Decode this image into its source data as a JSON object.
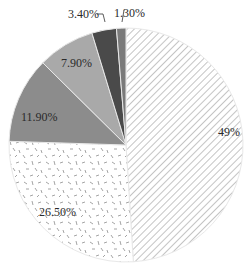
{
  "chart_data": {
    "type": "pie",
    "title": "",
    "start_angle": "12 o'clock",
    "direction": "clockwise",
    "slices": [
      {
        "label": "49%",
        "value": 49.0,
        "fill": "hatch-diagonal",
        "color": "#ffffff"
      },
      {
        "label": "26.50%",
        "value": 26.5,
        "fill": "dash-scatter",
        "color": "#ffffff"
      },
      {
        "label": "11.90%",
        "value": 11.9,
        "fill": "solid",
        "color": "#8c8c8c"
      },
      {
        "label": "7.90%",
        "value": 7.9,
        "fill": "solid",
        "color": "#a9a9a9"
      },
      {
        "label": "3.40%",
        "value": 3.4,
        "fill": "solid",
        "color": "#4a4a4a"
      },
      {
        "label": "1.30%",
        "value": 1.3,
        "fill": "solid",
        "color": "#7a7a7a"
      }
    ],
    "legend": null
  },
  "labels": {
    "s0": "49%",
    "s1": "26.50%",
    "s2": "11.90%",
    "s3": "7.90%",
    "s4": "3.40%",
    "s5": "1.30%"
  }
}
